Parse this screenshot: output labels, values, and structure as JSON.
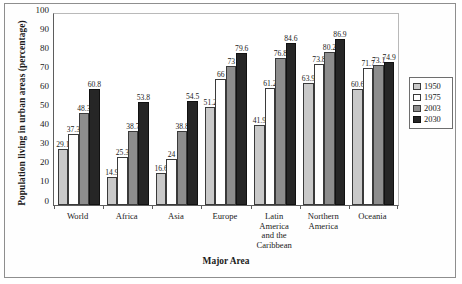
{
  "chart_data": {
    "type": "bar",
    "title": "",
    "xlabel": "Major Area",
    "ylabel": "Population living in urban areas (percentage)",
    "ylim": [
      0,
      100
    ],
    "ytick_step": 10,
    "yticks": [
      100,
      90,
      80,
      70,
      60,
      50,
      40,
      30,
      20,
      10,
      0
    ],
    "grid": false,
    "legend_position": "right",
    "categories": [
      "World",
      "Africa",
      "Asia",
      "Europe",
      "Latin America and the Caribbean",
      "Northern America",
      "Oceania"
    ],
    "category_lines": [
      [
        "World"
      ],
      [
        "Africa"
      ],
      [
        "Asia"
      ],
      [
        "Europe"
      ],
      [
        "Latin",
        "America",
        "and the",
        "Caribbean"
      ],
      [
        "Northern",
        "America"
      ],
      [
        "Oceania"
      ]
    ],
    "series": [
      {
        "name": "1950",
        "color": "#c9c9c9",
        "values": [
          29.1,
          14.9,
          16.6,
          51.2,
          41.9,
          63.9,
          60.6
        ]
      },
      {
        "name": "1975",
        "color": "#ffffff",
        "values": [
          37.3,
          25.3,
          24,
          66,
          61.2,
          73.8,
          71.7
        ]
      },
      {
        "name": "2003",
        "color": "#8d8d8d",
        "values": [
          48.3,
          38.7,
          38.8,
          73,
          76.8,
          80.2,
          73.1
        ]
      },
      {
        "name": "2030",
        "color": "#262626",
        "values": [
          60.8,
          53.8,
          54.5,
          79.6,
          84.6,
          86.9,
          74.9
        ]
      }
    ]
  }
}
